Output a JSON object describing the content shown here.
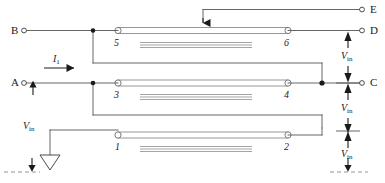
{
  "diagram": {
    "colors": {
      "wire": "#555555",
      "line_body": "#9a9a9a",
      "arrow": "#1a1a1a",
      "text": "#1a1a1a",
      "background": "#ffffff"
    },
    "terminals": [
      {
        "id": "B",
        "label": "B",
        "x": 14,
        "y": 32
      },
      {
        "id": "A",
        "label": "A",
        "x": 14,
        "y": 84
      },
      {
        "id": "E",
        "label": "E",
        "x": 368,
        "y": 10
      },
      {
        "id": "D",
        "label": "D",
        "x": 368,
        "y": 32
      },
      {
        "id": "C",
        "label": "C",
        "x": 368,
        "y": 85
      }
    ],
    "ports": [
      {
        "label": "5",
        "x": 117,
        "y": 45
      },
      {
        "label": "6",
        "x": 283,
        "y": 45
      },
      {
        "label": "3",
        "x": 117,
        "y": 97
      },
      {
        "label": "4",
        "x": 283,
        "y": 97
      },
      {
        "label": "1",
        "x": 117,
        "y": 149
      },
      {
        "label": "2",
        "x": 283,
        "y": 149
      }
    ],
    "annotations": [
      {
        "name": "current-label",
        "symbol": "I",
        "subscript": "1",
        "x": 48,
        "y": 62
      },
      {
        "name": "vin-label-left",
        "symbol": "V",
        "subscript": "in",
        "x": 24,
        "y": 128
      },
      {
        "name": "vin-label-right-top",
        "symbol": "V",
        "subscript": "in",
        "x": 338,
        "y": 58
      },
      {
        "name": "vin-label-right-mid",
        "symbol": "V",
        "subscript": "in",
        "x": 338,
        "y": 110
      },
      {
        "name": "vin-label-right-bottom",
        "symbol": "V",
        "subscript": "in",
        "x": 338,
        "y": 156
      }
    ],
    "transmission_lines": [
      {
        "name": "line-top",
        "ports": [
          "5",
          "6"
        ],
        "x1": 118,
        "x2": 288,
        "y": 32
      },
      {
        "name": "line-middle",
        "ports": [
          "3",
          "4"
        ],
        "x1": 118,
        "x2": 288,
        "y": 85
      },
      {
        "name": "line-bottom",
        "ports": [
          "1",
          "2"
        ],
        "x1": 118,
        "x2": 288,
        "y": 137
      }
    ],
    "ground": {
      "name": "ground-symbol",
      "x": 50,
      "y": 158
    }
  }
}
